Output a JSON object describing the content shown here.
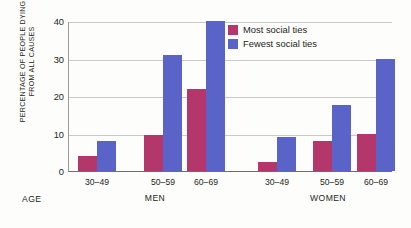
{
  "chart_data": {
    "type": "bar",
    "title": "",
    "xlabel": "AGE",
    "ylabel": "PERCENTAGE OF PEOPLE DYING\nFROM ALL CAUSES",
    "ylim": [
      0,
      40
    ],
    "yticks": [
      0,
      10,
      20,
      30,
      40
    ],
    "ytick_labels": [
      "0",
      "10",
      "20",
      "30",
      "40"
    ],
    "grid": true,
    "legend_position": "top-right",
    "categories": [
      "30–49",
      "50–59",
      "60–69",
      "30–49",
      "50–59",
      "60–69"
    ],
    "groups": [
      {
        "name": "MEN",
        "categories": [
          "30–49",
          "50–59",
          "60–69"
        ],
        "series": [
          {
            "name": "Most social ties",
            "values": [
              4,
              9.5,
              22
            ]
          },
          {
            "name": "Fewest social ties",
            "values": [
              8,
              31,
              40
            ]
          }
        ]
      },
      {
        "name": "WOMEN",
        "categories": [
          "30–49",
          "50–59",
          "60–69"
        ],
        "series": [
          {
            "name": "Most social ties",
            "values": [
              2.5,
              8,
              10
            ]
          },
          {
            "name": "Fewest social ties",
            "values": [
              9,
              17.5,
              30
            ]
          }
        ]
      }
    ],
    "series": [
      {
        "name": "Most social ties",
        "color": "#B4376B",
        "values": [
          4,
          9.5,
          22,
          2.5,
          8,
          10
        ]
      },
      {
        "name": "Fewest social ties",
        "color": "#5A63C8",
        "values": [
          8,
          31,
          40,
          9,
          17.5,
          30
        ]
      }
    ]
  },
  "axis": {
    "y_title": "PERCENTAGE OF PEOPLE DYING\nFROM ALL CAUSES",
    "y_labels": [
      "40",
      "30",
      "20",
      "10",
      "0"
    ],
    "age_label": "AGE",
    "x_labels": [
      "30–49",
      "50–59",
      "60–69",
      "30–49",
      "50–59",
      "60–69"
    ],
    "section_labels": [
      "MEN",
      "WOMEN"
    ]
  },
  "legend": {
    "items": [
      {
        "label": "Most social ties",
        "color": "#B4376B"
      },
      {
        "label": "Fewest social ties",
        "color": "#5A63C8"
      }
    ]
  }
}
